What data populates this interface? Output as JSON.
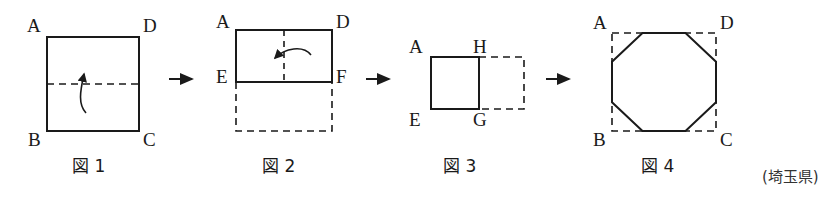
{
  "page": {
    "background_color": "#ffffff",
    "stroke_color": "#1a1a1a",
    "text_color": "#1a1a1a",
    "attribution": "(埼玉県)"
  },
  "figures": [
    {
      "id": "figure-1",
      "caption": "図 1",
      "description": "square ABCD with horizontal dashed fold line and upward curved fold arrow",
      "labels": [
        {
          "name": "A",
          "text": "A"
        },
        {
          "name": "D",
          "text": "D"
        },
        {
          "name": "B",
          "text": "B"
        },
        {
          "name": "C",
          "text": "C"
        }
      ]
    },
    {
      "id": "figure-2",
      "caption": "図 2",
      "description": "folded rectangle ADFE with vertical dashed fold line, dashed ghost rectangle below, leftward curved fold arrow",
      "labels": [
        {
          "name": "A",
          "text": "A"
        },
        {
          "name": "D",
          "text": "D"
        },
        {
          "name": "E",
          "text": "E"
        },
        {
          "name": "F",
          "text": "F"
        }
      ]
    },
    {
      "id": "figure-3",
      "caption": "図 3",
      "description": "folded square AHGE with dashed ghost square to the right",
      "labels": [
        {
          "name": "A",
          "text": "A"
        },
        {
          "name": "H",
          "text": "H"
        },
        {
          "name": "E",
          "text": "E"
        },
        {
          "name": "G",
          "text": "G"
        }
      ]
    },
    {
      "id": "figure-4",
      "caption": "図 4",
      "description": "regular octagon inscribed in dashed square ABCD",
      "labels": [
        {
          "name": "A",
          "text": "A"
        },
        {
          "name": "D",
          "text": "D"
        },
        {
          "name": "B",
          "text": "B"
        },
        {
          "name": "C",
          "text": "C"
        }
      ]
    }
  ],
  "arrows": [
    {
      "name": "arrow-1-to-2",
      "direction": "right"
    },
    {
      "name": "arrow-2-to-3",
      "direction": "right"
    },
    {
      "name": "arrow-3-to-4",
      "direction": "right"
    }
  ]
}
